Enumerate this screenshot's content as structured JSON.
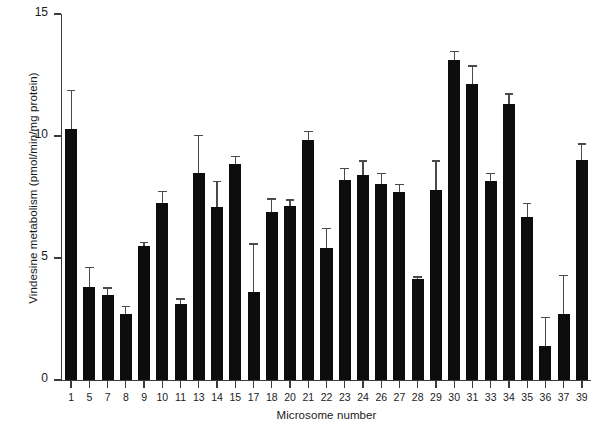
{
  "chart_data": {
    "type": "bar",
    "title": "",
    "xlabel": "Microsome number",
    "ylabel": "Vindesine metabolism (pmol/min/mg protein)",
    "ylim": [
      0,
      15
    ],
    "yticks": [
      0,
      5,
      10,
      15
    ],
    "ytick_labels": [
      "0",
      "5",
      "10",
      "15"
    ],
    "grid": false,
    "legend": "none",
    "error_bars": "upper only (SD)",
    "categories": [
      "1",
      "5",
      "7",
      "8",
      "9",
      "10",
      "11",
      "13",
      "14",
      "15",
      "17",
      "18",
      "20",
      "21",
      "22",
      "23",
      "24",
      "26",
      "27",
      "28",
      "29",
      "30",
      "31",
      "33",
      "34",
      "35",
      "36",
      "37",
      "39"
    ],
    "values": [
      10.3,
      3.8,
      3.5,
      2.7,
      5.5,
      7.25,
      3.1,
      8.5,
      7.1,
      8.85,
      3.6,
      6.9,
      7.15,
      9.85,
      5.4,
      8.2,
      8.4,
      8.05,
      7.7,
      4.15,
      7.8,
      13.1,
      12.15,
      8.15,
      11.3,
      6.7,
      1.4,
      2.7,
      9.0
    ],
    "errors": [
      1.6,
      0.85,
      0.3,
      0.35,
      0.15,
      0.5,
      0.25,
      1.55,
      1.05,
      0.35,
      2.0,
      0.55,
      0.25,
      0.35,
      0.85,
      0.5,
      0.6,
      0.45,
      0.35,
      0.1,
      1.2,
      0.4,
      0.75,
      0.35,
      0.45,
      0.55,
      1.2,
      1.6,
      0.7
    ],
    "bar_color": "#0d0d0d",
    "axis_color": "#3b3b3b"
  },
  "axes": {
    "y_title": "Vindesine metabolism (pmol/min/mg protein)",
    "x_title": "Microsome number"
  }
}
